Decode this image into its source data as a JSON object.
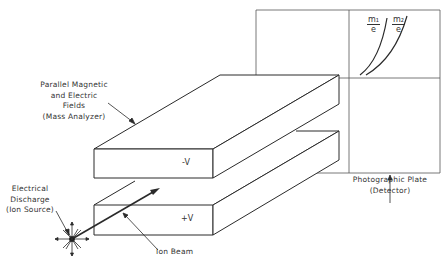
{
  "diagram": {
    "labels": {
      "analyzer": [
        "Parallel Magnetic",
        "and Electric",
        "Fields",
        "(Mass Analyzer)"
      ],
      "source": [
        "Electrical",
        "Discharge",
        "(Ion Source)"
      ],
      "beam": "Ion Beam",
      "detector": [
        "Photographic Plate",
        "(Detector)"
      ],
      "top_plate_voltage": "-V",
      "bottom_plate_voltage": "+V",
      "mass1_num": "m₁",
      "mass1_den": "e",
      "mass2_num": "m₂",
      "mass2_den": "e"
    },
    "colors": {
      "line": "#2a2a2a",
      "text": "#333333",
      "background": "#ffffff"
    }
  }
}
